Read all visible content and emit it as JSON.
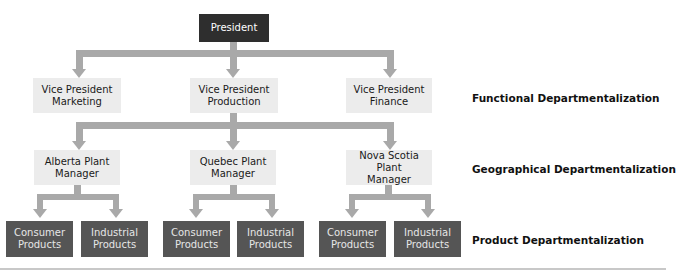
{
  "chart": {
    "top": {
      "label": "President"
    },
    "functional": [
      {
        "label": "Vice President\nMarketing"
      },
      {
        "label": "Vice President\nProduction"
      },
      {
        "label": "Vice President\nFinance"
      }
    ],
    "geographical": [
      {
        "label": "Alberta Plant\nManager"
      },
      {
        "label": "Quebec Plant\nManager"
      },
      {
        "label": "Nova Scotia Plant\nManager"
      }
    ],
    "product": [
      {
        "label": "Consumer\nProducts"
      },
      {
        "label": "Industrial\nProducts"
      },
      {
        "label": "Consumer\nProducts"
      },
      {
        "label": "Industrial\nProducts"
      },
      {
        "label": "Consumer\nProducts"
      },
      {
        "label": "Industrial\nProducts"
      }
    ]
  },
  "levels": {
    "functional": "Functional Departmentalization",
    "geographical": "Geographical Departmentalization",
    "product": "Product Departmentalization"
  },
  "colors": {
    "president_box": "#2e2e2e",
    "light_box": "#ececec",
    "product_box": "#555555",
    "connector": "#a9a9a9"
  }
}
